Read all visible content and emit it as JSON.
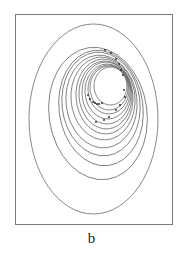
{
  "figure": {
    "label": "b",
    "frame": {
      "x": 15,
      "y": 14,
      "width": 158,
      "height": 211,
      "color": "#7a7a7a"
    },
    "curve_color": "#555555",
    "dot_color": "#222222",
    "outer_ellipse": {
      "cx": 93.5,
      "cy": 119,
      "rx": 64.5,
      "ry": 95
    },
    "rotation_deg": -8,
    "nested_ellipses": [
      {
        "L": 94,
        "R": 127,
        "T": 67,
        "B": 105
      },
      {
        "L": 90,
        "R": 128,
        "T": 66,
        "B": 110
      },
      {
        "L": 88,
        "R": 129,
        "T": 65,
        "B": 114
      },
      {
        "L": 85,
        "R": 130,
        "T": 64,
        "B": 119
      },
      {
        "L": 82,
        "R": 131,
        "T": 62,
        "B": 124
      },
      {
        "L": 79,
        "R": 132,
        "T": 61,
        "B": 129
      },
      {
        "L": 76,
        "R": 133,
        "T": 59,
        "B": 134
      },
      {
        "L": 71,
        "R": 135,
        "T": 57,
        "B": 140
      },
      {
        "L": 66,
        "R": 137,
        "T": 55,
        "B": 148
      },
      {
        "L": 62,
        "R": 140,
        "T": 52,
        "B": 156
      },
      {
        "L": 59,
        "R": 143,
        "T": 50,
        "B": 166
      },
      {
        "L": 49,
        "R": 147,
        "T": 47,
        "B": 180
      }
    ],
    "points": [
      [
        105,
        50
      ],
      [
        111,
        53
      ],
      [
        116,
        59
      ],
      [
        119,
        64
      ],
      [
        121,
        70
      ],
      [
        123,
        75
      ],
      [
        124,
        90
      ],
      [
        125,
        97
      ],
      [
        120,
        105
      ],
      [
        116,
        110
      ],
      [
        109,
        117
      ],
      [
        104,
        120
      ],
      [
        96,
        122
      ],
      [
        88,
        95
      ],
      [
        90,
        99
      ],
      [
        93,
        102
      ],
      [
        95,
        103
      ],
      [
        97,
        104
      ],
      [
        99,
        104
      ],
      [
        102,
        103
      ]
    ]
  }
}
